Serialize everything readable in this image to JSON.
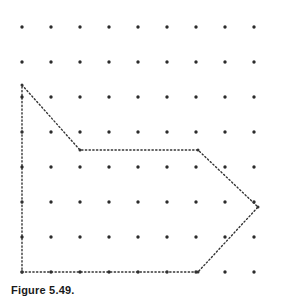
{
  "figure": {
    "caption": "Figure 5.49.",
    "caption_color": "#1a1a1a",
    "background_color": "#ffffff"
  },
  "geoboard": {
    "grid_columns": 9,
    "grid_rows": 8,
    "origin_x": 22,
    "origin_y": 27,
    "spacing_x": 29,
    "spacing_y": 35,
    "dot_color": "#2b2b2b",
    "dot_radius": 1.7,
    "line_color": "#333333",
    "line_style": "dotted"
  },
  "chart_data": {
    "type": "scatter",
    "title": "Figure 5.49.",
    "xlabel": "",
    "ylabel": "",
    "grid": true,
    "legend": null,
    "dot_grid": {
      "columns": 9,
      "rows": 8,
      "col_x": [
        22,
        51,
        80,
        109,
        138,
        167,
        196,
        225,
        254
      ],
      "row_y": [
        27,
        62,
        97,
        132,
        167,
        202,
        237,
        272
      ]
    },
    "polygon": {
      "name": "arrow-hexagon",
      "closed": true,
      "vertices_grid": [
        {
          "col": 0,
          "row": 1.66,
          "label": "top-left"
        },
        {
          "col": 2,
          "row": 3.5,
          "label": "notch"
        },
        {
          "col": 6,
          "row": 3.5,
          "label": "shoulder-top"
        },
        {
          "col": 8.1,
          "row": 5.15,
          "label": "arrow-tip"
        },
        {
          "col": 6,
          "row": 7,
          "label": "shoulder-bottom"
        },
        {
          "col": 0,
          "row": 7,
          "label": "bottom-left"
        }
      ],
      "vertices_px": [
        {
          "x": 22,
          "y": 85
        },
        {
          "x": 80,
          "y": 150
        },
        {
          "x": 198,
          "y": 150
        },
        {
          "x": 258,
          "y": 207
        },
        {
          "x": 198,
          "y": 272
        },
        {
          "x": 22,
          "y": 272
        }
      ],
      "edges": [
        {
          "from": "top-left",
          "to": "notch",
          "orientation": "diagonal"
        },
        {
          "from": "notch",
          "to": "shoulder-top",
          "orientation": "horizontal"
        },
        {
          "from": "shoulder-top",
          "to": "arrow-tip",
          "orientation": "diagonal"
        },
        {
          "from": "arrow-tip",
          "to": "shoulder-bottom",
          "orientation": "diagonal"
        },
        {
          "from": "shoulder-bottom",
          "to": "bottom-left",
          "orientation": "horizontal"
        },
        {
          "from": "bottom-left",
          "to": "top-left",
          "orientation": "vertical"
        }
      ]
    }
  }
}
